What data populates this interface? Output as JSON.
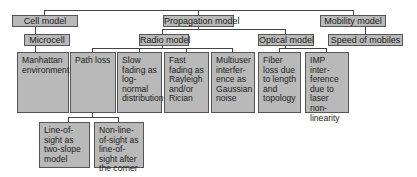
{
  "diagram": {
    "level1": {
      "cell_model": "Cell model",
      "propagation_model": "Propagation model",
      "mobility_model": "Mobility model"
    },
    "level2": {
      "microcell": "Microcell",
      "radio_model": "Radio model",
      "optical_model": "Optical model",
      "speed_of_mobiles": "Speed of mobiles"
    },
    "level3": {
      "manhattan": "Manhattan environment",
      "path_loss": "Path loss",
      "slow_fading": "Slow fading as log-normal distribution",
      "fast_fading": "Fast fading as Rayleigh and/or Rician",
      "multiuser": "Multiuser interfer-ence as Gaussian noise",
      "fiber_loss": "Fiber loss due to length and topology",
      "imp": "IMP inter-ference due to laser non-linearity"
    },
    "level4": {
      "los": "Line-of-sight as two-slope model",
      "nlos": "Non-line-of-sight as line-of-sight after the corner"
    },
    "colors": {
      "box_fill": "#b9b9b9",
      "box_border": "#555555",
      "line": "#444444"
    }
  }
}
